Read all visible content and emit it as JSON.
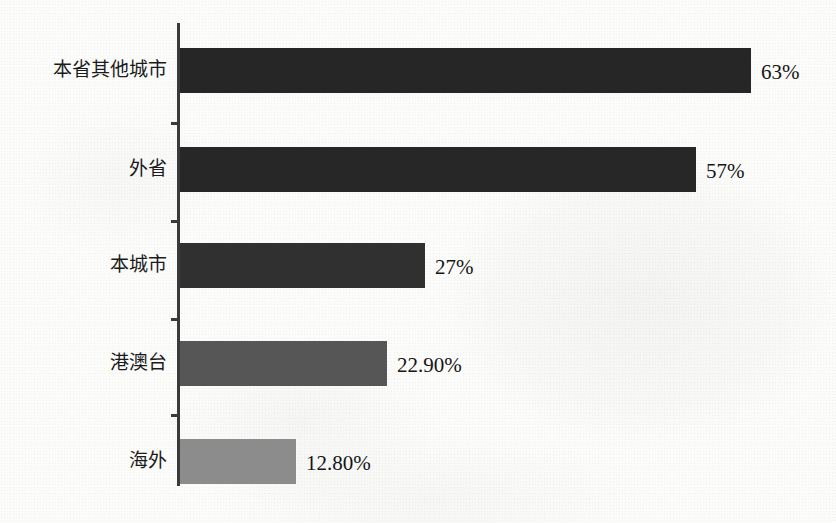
{
  "chart_data": {
    "type": "bar",
    "orientation": "horizontal",
    "title": "",
    "subtitle": "",
    "xlabel": "",
    "ylabel": "",
    "categories": [
      "本省其他城市",
      "外省",
      "本城市",
      "港澳台",
      "海外"
    ],
    "values": [
      63,
      57,
      27,
      22.9,
      12.8
    ],
    "value_labels": [
      "63%",
      "57%",
      "27%",
      "22.90%",
      "12.80%"
    ],
    "bar_colors": [
      "#262626",
      "#272727",
      "#303030",
      "#565656",
      "#8c8c8c"
    ],
    "xlim": [
      0,
      70
    ],
    "grid": false,
    "legend": null,
    "legend_position": "none",
    "axis_color": "#3a3a3a",
    "background_color": "#fcfcfb",
    "series": [
      {
        "name": "",
        "points": [
          {
            "category": "本省其他城市",
            "value": 63,
            "label": "63%",
            "color": "#262626"
          },
          {
            "category": "外省",
            "value": 57,
            "label": "57%",
            "color": "#272727"
          },
          {
            "category": "本城市",
            "value": 27,
            "label": "27%",
            "color": "#303030"
          },
          {
            "category": "港澳台",
            "value": 22.9,
            "label": "22.90%",
            "color": "#565656"
          },
          {
            "category": "海外",
            "value": 12.8,
            "label": "12.80%",
            "color": "#8c8c8c"
          }
        ]
      }
    ]
  }
}
